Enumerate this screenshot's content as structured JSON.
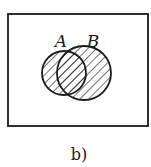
{
  "diagram": {
    "type": "venn",
    "universe": {
      "x": 8,
      "y": 14,
      "width": 140,
      "height": 112
    },
    "sets": [
      {
        "label": "A",
        "cx": 64,
        "cy": 73,
        "r": 22,
        "label_x": 61,
        "label_y": 47,
        "shaded": true
      },
      {
        "label": "B",
        "cx": 84,
        "cy": 73,
        "r": 27,
        "label_x": 93,
        "label_y": 47,
        "shaded": true
      }
    ],
    "shaded_region": "A ∪ B",
    "hatch": "diagonal",
    "caption": "b)",
    "colors": {
      "stroke": "#1a1a1a",
      "background": "#ffffff"
    }
  }
}
